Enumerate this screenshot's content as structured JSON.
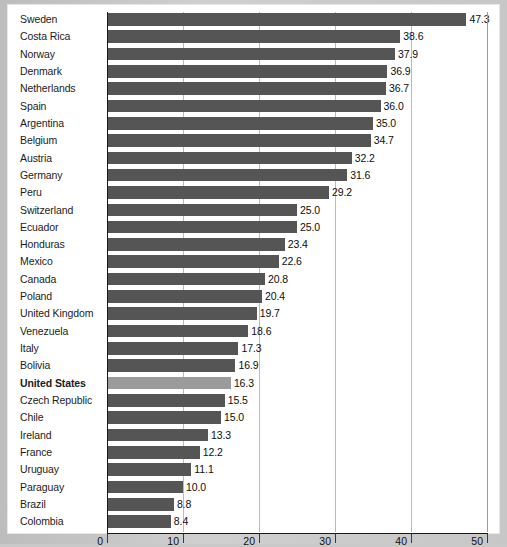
{
  "chart_data": {
    "type": "bar",
    "orientation": "horizontal",
    "title": "",
    "subtitle": "",
    "xlabel": "",
    "ylabel": "",
    "xlim": [
      0,
      50
    ],
    "xticks": [
      0,
      10,
      20,
      30,
      40,
      50
    ],
    "xtick_labels": [
      "0",
      "10",
      "20",
      "30",
      "40",
      "50"
    ],
    "grid": true,
    "grid_axis": "x",
    "legend": false,
    "value_labels": true,
    "bar_color": "#555555",
    "highlight_color": "#9b9b9b",
    "highlight_category": "United States",
    "categories": [
      "Sweden",
      "Costa Rica",
      "Norway",
      "Denmark",
      "Netherlands",
      "Spain",
      "Argentina",
      "Belgium",
      "Austria",
      "Germany",
      "Peru",
      "Switzerland",
      "Ecuador",
      "Honduras",
      "Mexico",
      "Canada",
      "Poland",
      "United Kingdom",
      "Venezuela",
      "Italy",
      "Bolivia",
      "United States",
      "Czech Republic",
      "Chile",
      "Ireland",
      "France",
      "Uruguay",
      "Paraguay",
      "Brazil",
      "Colombia"
    ],
    "values": [
      47.3,
      38.6,
      37.9,
      36.9,
      36.7,
      36.0,
      35.0,
      34.7,
      32.2,
      31.6,
      29.2,
      25.0,
      25.0,
      23.4,
      22.6,
      20.8,
      20.4,
      19.7,
      18.6,
      17.3,
      16.9,
      16.3,
      15.5,
      15.0,
      13.3,
      12.2,
      11.1,
      10.0,
      8.8,
      8.4
    ],
    "value_text": [
      "47.3",
      "38.6",
      "37.9",
      "36.9",
      "36.7",
      "36.0",
      "35.0",
      "34.7",
      "32.2",
      "31.6",
      "29.2",
      "25.0",
      "25.0",
      "23.4",
      "22.6",
      "20.8",
      "20.4",
      "19.7",
      "18.6",
      "17.3",
      "16.9",
      "16.3",
      "15.5",
      "15.0",
      "13.3",
      "12.2",
      "11.1",
      "10.0",
      "8.8",
      "8.4"
    ]
  }
}
